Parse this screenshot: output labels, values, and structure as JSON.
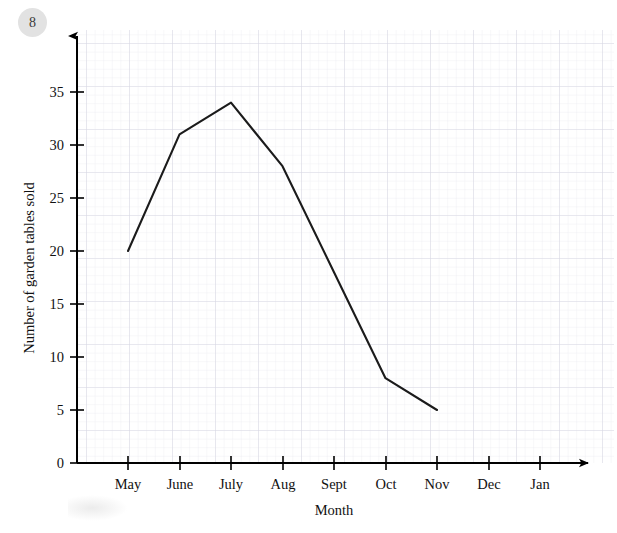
{
  "question_number": "8",
  "chart_data": {
    "type": "line",
    "title": "",
    "xlabel": "Month",
    "ylabel": "Number of garden tables sold",
    "categories": [
      "May",
      "June",
      "July",
      "Aug",
      "Sept",
      "Oct",
      "Nov",
      "Dec",
      "Jan"
    ],
    "x_tick_labels": [
      "May",
      "June",
      "July",
      "Aug",
      "Sept",
      "Oct",
      "Nov",
      "Dec",
      "Jan"
    ],
    "y_tick_labels": [
      "0",
      "5",
      "10",
      "15",
      "20",
      "25",
      "30",
      "35"
    ],
    "y_ticks": [
      0,
      5,
      10,
      15,
      20,
      25,
      30,
      35
    ],
    "ylim": [
      0,
      38
    ],
    "values": [
      20,
      31,
      34,
      28,
      18,
      8,
      5,
      null,
      null
    ],
    "series": [
      {
        "name": "Number of garden tables sold",
        "points": [
          {
            "x": "May",
            "y": 20
          },
          {
            "x": "June",
            "y": 31
          },
          {
            "x": "July",
            "y": 34
          },
          {
            "x": "Aug",
            "y": 28
          },
          {
            "x": "Sept",
            "y": 18
          },
          {
            "x": "Oct",
            "y": 8
          },
          {
            "x": "Nov",
            "y": 5
          }
        ]
      }
    ],
    "grid": true,
    "grid_minor_step": 1,
    "grid_major_step": 5,
    "legend": false,
    "legend_position": "none",
    "line_color": "#1b1b1b",
    "grid_color": "#e8e8ee",
    "grid_major_color": "#d7d7e2",
    "axis_color": "#000000"
  }
}
